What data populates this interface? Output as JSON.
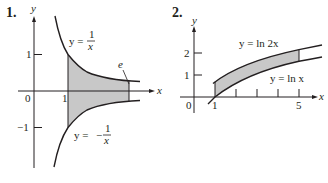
{
  "figures": [
    {
      "number": "1.",
      "axis_x": "x",
      "axis_y": "y",
      "origin": "0",
      "ticks_x": [
        "1"
      ],
      "ticks_y": [
        "1",
        "−1"
      ],
      "curves": [
        {
          "label_lhs": "y =",
          "label_num": "1",
          "label_den": "x",
          "sign": ""
        },
        {
          "label_lhs": "y =",
          "label_num": "1",
          "label_den": "x",
          "sign": "−"
        }
      ],
      "annotation": "e",
      "shaded_region": "between y=1/x and y=-1/x from x=1 to x=e"
    },
    {
      "number": "2.",
      "axis_x": "x",
      "axis_y": "y",
      "origin": "0",
      "ticks_x": [
        "1",
        "5"
      ],
      "ticks_y": [
        "2",
        "1"
      ],
      "curves": [
        {
          "label": "y = ln 2x"
        },
        {
          "label": "y = ln x"
        }
      ],
      "shaded_region": "between y=ln 2x and y=ln x from x=1 to x=5"
    }
  ],
  "colors": {
    "ink": "#231f20",
    "shade": "#c8c8c8"
  }
}
